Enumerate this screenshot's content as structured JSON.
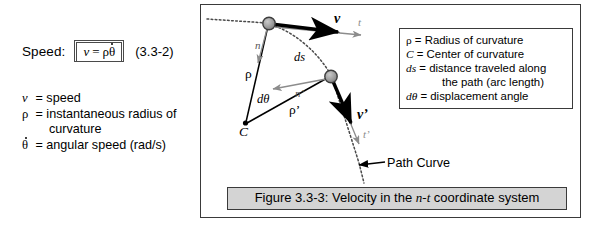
{
  "left": {
    "speed_label": "Speed:",
    "equation": {
      "lhs": "v",
      "equals": "=",
      "rho": "ρ",
      "theta_dot": "θ"
    },
    "equation_number": "(3.3-2)",
    "nomenclature": [
      {
        "symbol": "v",
        "text": "= speed"
      },
      {
        "symbol": "ρ",
        "text": "= instantaneous radius of"
      },
      {
        "symbol": "",
        "text": "curvature",
        "indent": true
      },
      {
        "symbol": "θ",
        "text": "= angular speed (rad/s)",
        "dotted": true
      }
    ]
  },
  "figure": {
    "caption": "Figure 3.3-3: Velocity in the n-t coordinate system",
    "caption_parts": {
      "prefix": "Figure 3.3-3: Velocity in the ",
      "italic": "n-t",
      "suffix": " coordinate system"
    },
    "path_curve_label": "Path Curve",
    "legend": [
      {
        "symbol": "ρ",
        "text": "= Radius of curvature"
      },
      {
        "symbol": "C",
        "text": "= Center of curvature",
        "italic": true
      },
      {
        "symbol": "ds",
        "text": "= distance traveled along",
        "italic": true
      },
      {
        "symbol": "",
        "text": "the path (arc length)",
        "indent": true
      },
      {
        "symbol": "dθ",
        "text": "= displacement angle",
        "italic": true
      }
    ],
    "labels": {
      "v": "v",
      "t": "t",
      "n": "n",
      "ds": "ds",
      "rho": "ρ",
      "rho_prime": "ρ’",
      "d_theta": "dθ",
      "n_prime": "n’",
      "v_prime": "v’",
      "t_prime": "t’",
      "center": "C"
    },
    "colors": {
      "panel_border": "#3a3a3a",
      "caption_background": "#d4d4d4",
      "node_fill": "#9a9a9a",
      "axis_gray": "#8c8c8c",
      "path_dotted": "#4a4a4a",
      "vector_black": "#000000"
    },
    "geometry": {
      "node1": [
        68,
        18
      ],
      "node2": [
        130,
        71
      ],
      "center_C": [
        44,
        118
      ]
    }
  }
}
